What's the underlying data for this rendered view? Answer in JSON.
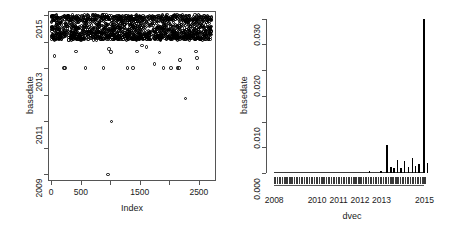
{
  "figure": {
    "type": "r-base-graphics-two-panel",
    "background": "#ffffff",
    "foreground": "#000000",
    "axis_color": "#555555"
  },
  "left_panel": {
    "name": "scatter-index-vs-basedate",
    "ylabel": "basedate",
    "xlabel": "Index",
    "y_ticks": [
      "2009",
      "2011",
      "2013",
      "2015"
    ],
    "x_ticks": [
      "0",
      "500",
      "1500",
      "2500"
    ],
    "frame": "box"
  },
  "right_panel": {
    "name": "density-dvec-vs-basedate",
    "ylabel": "basedate",
    "xlabel": "dvec",
    "y_ticks": [
      "0.000",
      "0.010",
      "0.020",
      "0.030"
    ],
    "x_ticks": [
      "2008",
      "2010",
      "2011",
      "2012",
      "2013",
      "2015"
    ],
    "frame": "L-axes"
  },
  "chart_data": [
    {
      "type": "scatter",
      "panel": "left",
      "title": "",
      "xlabel": "Index",
      "ylabel": "basedate",
      "xlim": [
        -55,
        2790
      ],
      "ylim": [
        2008.75,
        2015.15
      ],
      "xticks": [
        0,
        500,
        1000,
        1500,
        2000,
        2500
      ],
      "xticklabels": [
        "0",
        "500",
        "",
        "1500",
        "",
        "2500"
      ],
      "yticks": [
        2009,
        2010,
        2011,
        2012,
        2013,
        2014,
        2015
      ],
      "yticklabels": [
        "2009",
        "",
        "2011",
        "",
        "2013",
        "",
        "2015"
      ],
      "grid": false,
      "legend": false,
      "marker": "open-circle",
      "note": "Dense band of points spanning basedate 2014.05-2015.0 across all Index values; sparse outliers below.",
      "dense_band": {
        "y_min": 2014.05,
        "y_max": 2015.0,
        "x_min": 0,
        "x_max": 2720,
        "approx_count": 2600
      },
      "outliers": [
        {
          "x": 55,
          "y": 2013.45
        },
        {
          "x": 215,
          "y": 2013.0
        },
        {
          "x": 232,
          "y": 2013.0
        },
        {
          "x": 420,
          "y": 2013.62
        },
        {
          "x": 575,
          "y": 2013.0
        },
        {
          "x": 880,
          "y": 2013.0
        },
        {
          "x": 975,
          "y": 2013.72
        },
        {
          "x": 1010,
          "y": 2013.6
        },
        {
          "x": 1020,
          "y": 2011.0
        },
        {
          "x": 960,
          "y": 2009.0
        },
        {
          "x": 1290,
          "y": 2013.0
        },
        {
          "x": 1385,
          "y": 2013.0
        },
        {
          "x": 1450,
          "y": 2013.62
        },
        {
          "x": 1540,
          "y": 2013.85
        },
        {
          "x": 1610,
          "y": 2013.8
        },
        {
          "x": 1750,
          "y": 2013.15
        },
        {
          "x": 1830,
          "y": 2013.58
        },
        {
          "x": 1900,
          "y": 2013.0
        },
        {
          "x": 2030,
          "y": 2013.0
        },
        {
          "x": 2140,
          "y": 2013.0
        },
        {
          "x": 2165,
          "y": 2013.0
        },
        {
          "x": 2180,
          "y": 2013.3
        },
        {
          "x": 2270,
          "y": 2011.85
        },
        {
          "x": 2450,
          "y": 2013.62
        },
        {
          "x": 2470,
          "y": 2013.38
        },
        {
          "x": 2480,
          "y": 2013.0
        }
      ]
    },
    {
      "type": "line",
      "subtype": "density-with-rug",
      "panel": "right",
      "title": "",
      "xlabel": "dvec",
      "ylabel": "basedate",
      "xlim": [
        2007.9,
        2015.35
      ],
      "ylim": [
        0.0,
        0.0315
      ],
      "xticks": [
        2008,
        2010,
        2011,
        2012,
        2013,
        2015
      ],
      "xticklabels": [
        "2008",
        "2010",
        "2011",
        "2012",
        "2013",
        "2015"
      ],
      "yticks": [
        0.0,
        0.005,
        0.01,
        0.015,
        0.02,
        0.025,
        0.03
      ],
      "yticklabels": [
        "0.000",
        "",
        "0.010",
        "",
        "0.020",
        "",
        "0.030"
      ],
      "grid": false,
      "legend": false,
      "rug": true,
      "note": "Flat near zero from 2008 to 2012.8, small bump ~2012.4, cluster of spikes from 2013.2 onward, dominant spike at 2014.95 reaching 0.030.",
      "spikes": [
        {
          "x": 2012.42,
          "y": 0.00035
        },
        {
          "x": 2012.95,
          "y": 0.0003
        },
        {
          "x": 2013.22,
          "y": 0.00545
        },
        {
          "x": 2013.4,
          "y": 0.0012
        },
        {
          "x": 2013.55,
          "y": 0.00095
        },
        {
          "x": 2013.72,
          "y": 0.0026
        },
        {
          "x": 2013.88,
          "y": 0.00105
        },
        {
          "x": 2014.05,
          "y": 0.00235
        },
        {
          "x": 2014.22,
          "y": 0.00115
        },
        {
          "x": 2014.4,
          "y": 0.003
        },
        {
          "x": 2014.55,
          "y": 0.00145
        },
        {
          "x": 2014.72,
          "y": 0.00175
        },
        {
          "x": 2014.95,
          "y": 0.03
        },
        {
          "x": 2015.1,
          "y": 0.00185
        }
      ],
      "baseline_y": 0.00012
    }
  ]
}
